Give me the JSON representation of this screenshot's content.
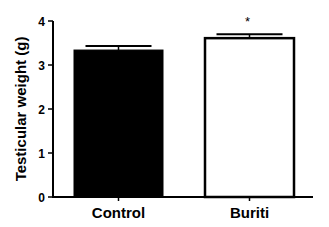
{
  "chart_data": {
    "type": "bar",
    "title": "",
    "xlabel": "",
    "ylabel": "Testicular weight (g)",
    "categories": [
      "Control",
      "Buriti"
    ],
    "values": [
      3.34,
      3.61
    ],
    "errors": [
      0.09,
      0.09
    ],
    "bar_fill": [
      "#000000",
      "#ffffff"
    ],
    "bar_stroke": "#000000",
    "annotations": [
      {
        "category": "Buriti",
        "text": "*"
      }
    ],
    "ylim": [
      0,
      4
    ],
    "yticks": [
      0,
      1,
      2,
      3,
      4
    ],
    "grid": false,
    "legend": null
  }
}
